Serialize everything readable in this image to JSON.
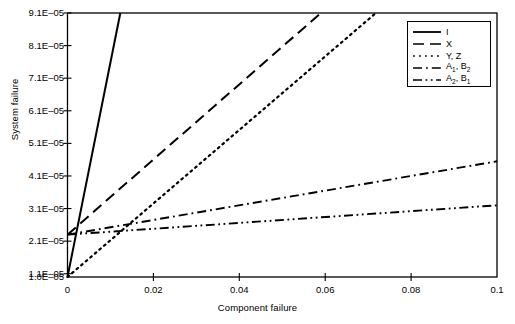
{
  "chart_data": {
    "type": "line",
    "title": "",
    "xlabel": "Component failure",
    "ylabel": "System failure",
    "xlim": [
      0,
      0.1
    ],
    "ylim": [
      1e-05,
      9.1e-05
    ],
    "grid": false,
    "legend_position": "top-right",
    "xticks": [
      0,
      0.02,
      0.04,
      0.06,
      0.08,
      0.1
    ],
    "xtick_labels": [
      "0",
      "0.02",
      "0.04",
      "0.06",
      "0.08",
      "0.1"
    ],
    "yticks": [
      1e-05,
      1.1e-05,
      2.1e-05,
      3.1e-05,
      4.1e-05,
      5.1e-05,
      6.1e-05,
      7.1e-05,
      8.1e-05,
      9.1e-05
    ],
    "ytick_labels": [
      "1.0E–05",
      "1.1E–05",
      "2.1E–05",
      "3.1E–05",
      "4.1E–05",
      "5.1E–05",
      "6.1E–05",
      "7.1E–05",
      "8.1E–05",
      "9.1E–05"
    ],
    "series": [
      {
        "name": "I",
        "style": "solid",
        "x": [
          0,
          0.0123
        ],
        "y": [
          1e-05,
          9.1e-05
        ]
      },
      {
        "name": "X",
        "style": "dashed",
        "x": [
          0,
          0.059
        ],
        "y": [
          2.3e-05,
          9.1e-05
        ]
      },
      {
        "name": "Y, Z",
        "style": "dotted",
        "x": [
          0,
          0.0718
        ],
        "y": [
          1e-05,
          9.1e-05
        ]
      },
      {
        "name": "A1, B2",
        "style": "dashdot",
        "x": [
          0,
          0.1
        ],
        "y": [
          2.3e-05,
          4.55e-05
        ]
      },
      {
        "name": "A2, B1",
        "style": "dashdotdot",
        "x": [
          0,
          0.1
        ],
        "y": [
          2.3e-05,
          3.2e-05
        ]
      }
    ]
  },
  "legend": {
    "entries": [
      {
        "label": "I",
        "base": "I",
        "sub": "",
        "base2": "",
        "sub2": ""
      },
      {
        "label": "X",
        "base": "X",
        "sub": "",
        "base2": "",
        "sub2": ""
      },
      {
        "label": "Y, Z",
        "base": "Y, Z",
        "sub": "",
        "base2": "",
        "sub2": ""
      },
      {
        "label": "A1, B2",
        "base": "A",
        "sub": "1",
        "base2": ", B",
        "sub2": "2"
      },
      {
        "label": "A2, B1",
        "base": "A",
        "sub": "2",
        "base2": ", B",
        "sub2": "1"
      }
    ]
  },
  "axes": {
    "x_title": "Component failure",
    "y_title": "System failure"
  },
  "colors": {
    "line": "#000000",
    "axis": "#000000",
    "background": "#ffffff"
  }
}
